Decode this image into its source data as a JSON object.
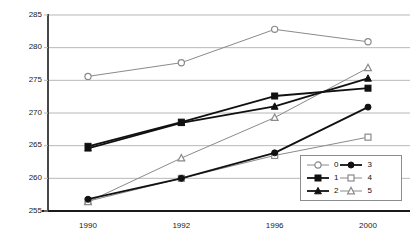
{
  "chart_data": {
    "type": "line",
    "title": "",
    "subtitle": "",
    "xlabel": "",
    "ylabel": "",
    "categories": [
      "1990",
      "1992",
      "1996",
      "2000"
    ],
    "ylim": [
      255,
      285
    ],
    "yticks": [
      255,
      260,
      265,
      270,
      275,
      280,
      285
    ],
    "ytick_labels": [
      "255",
      "260",
      "265",
      "270",
      "275",
      "280",
      "285"
    ],
    "grid": true,
    "grid_axis": "y",
    "legend_position": "lower right",
    "legend_columns": 2,
    "series": [
      {
        "name": "0",
        "marker": "open-circle",
        "color": "#8a8a8a",
        "line_color": "#8a8a8a",
        "values": [
          275.6,
          277.7,
          282.8,
          280.9
        ]
      },
      {
        "name": "1",
        "marker": "filled-square",
        "color": "#111111",
        "line_color": "#111111",
        "values": [
          264.9,
          268.6,
          272.6,
          273.8
        ]
      },
      {
        "name": "2",
        "marker": "filled-triangle",
        "color": "#111111",
        "line_color": "#111111",
        "values": [
          264.6,
          268.5,
          271.0,
          275.3
        ]
      },
      {
        "name": "3",
        "marker": "filled-circle",
        "color": "#111111",
        "line_color": "#111111",
        "values": [
          256.8,
          260.0,
          263.9,
          270.9
        ]
      },
      {
        "name": "4",
        "marker": "open-square",
        "color": "#8a8a8a",
        "line_color": "#8a8a8a",
        "values": [
          256.5,
          260.0,
          263.5,
          266.3
        ]
      },
      {
        "name": "5",
        "marker": "open-triangle",
        "color": "#8a8a8a",
        "line_color": "#8a8a8a",
        "values": [
          256.4,
          263.1,
          269.3,
          276.9
        ]
      }
    ]
  },
  "legend": {
    "columns": [
      {
        "entries": [
          {
            "label": "0"
          },
          {
            "label": "1"
          },
          {
            "label": "2"
          }
        ]
      },
      {
        "entries": [
          {
            "label": "3"
          },
          {
            "label": "4"
          },
          {
            "label": "5"
          }
        ]
      }
    ]
  },
  "colors": {
    "axis": "#1a1a1a",
    "grid": "#b8b8b8",
    "dark_series": "#111111",
    "light_series": "#8a8a8a",
    "legend_border": "#8c8c8c",
    "background": "#ffffff"
  }
}
